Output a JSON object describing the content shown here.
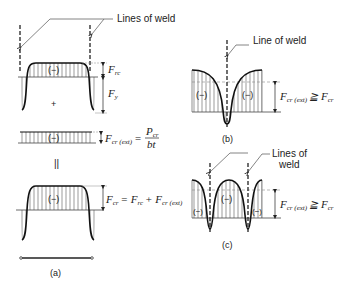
{
  "figure": {
    "panel_a": {
      "caption": "(a)",
      "weld_label": "Lines of weld",
      "residual": {
        "sign_compression": "(−)",
        "sign_tension": "+",
        "f_rc_main": "F",
        "f_rc_sub": "rc",
        "f_y_main": "F",
        "f_y_sub": "y"
      },
      "external": {
        "sign": "(−)",
        "lhs_main": "F",
        "lhs_sub": "cr (ext)",
        "equals": "=",
        "numerator_main": "P",
        "numerator_sub": "cr",
        "denominator": "bt"
      },
      "equals_symbol": "||",
      "combined": {
        "sign": "(−)",
        "lhs_main": "F",
        "lhs_sub": "cr",
        "rhs": "= F",
        "rhs_sub1": "rc",
        "plus": "+ F",
        "rhs_sub2": "cr (ext)"
      }
    },
    "panel_b": {
      "caption": "(b)",
      "weld_label": "Line of weld",
      "sign_left": "(−)",
      "sign_right": "(−)",
      "relation_main": "F",
      "relation_sub": "cr (ext)",
      "relation_op": "≧ F",
      "relation_sub2": "cr"
    },
    "panel_c": {
      "caption": "(c)",
      "weld_label_line1": "Lines of",
      "weld_label_line2": "weld",
      "sign_left": "(−)",
      "sign_mid": "(−)",
      "sign_right": "(−)",
      "relation_main": "F",
      "relation_sub": "cr (ext)",
      "relation_op": "≧ F",
      "relation_sub2": "cr"
    }
  }
}
